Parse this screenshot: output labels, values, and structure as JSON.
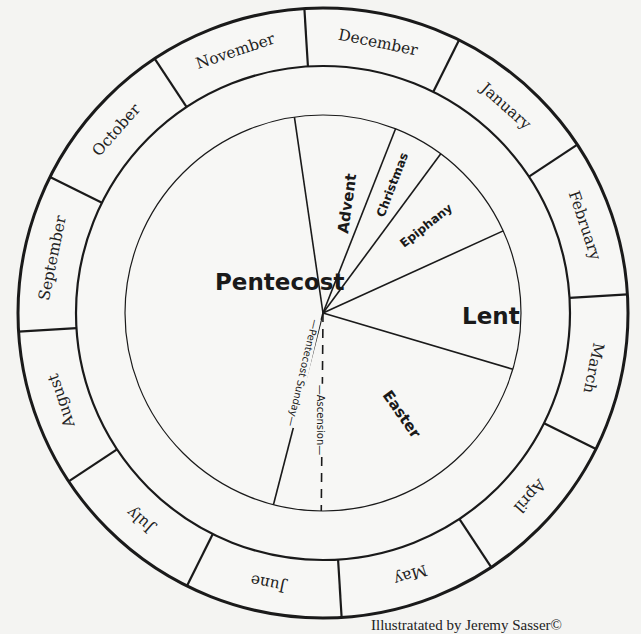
{
  "diagram": {
    "center": [
      323,
      313
    ],
    "radii": {
      "outer": 305,
      "month_inner": 247,
      "band_inner": 198
    },
    "colors": {
      "background": "#f4f4f2",
      "line": "#1a1a1a",
      "grey_band": "#565656",
      "dark_band": "#1e1e1e",
      "white_band": "#f7f7f5"
    },
    "month_divider_offset_deg": -3.5,
    "months": [
      {
        "label": "December",
        "mid_deg": 11.5
      },
      {
        "label": "January",
        "mid_deg": 41.5
      },
      {
        "label": "February",
        "mid_deg": 71.5
      },
      {
        "label": "March",
        "mid_deg": 101.5
      },
      {
        "label": "April",
        "mid_deg": 131.5
      },
      {
        "label": "May",
        "mid_deg": 161.5
      },
      {
        "label": "June",
        "mid_deg": 191.5
      },
      {
        "label": "July",
        "mid_deg": 221.5
      },
      {
        "label": "August",
        "mid_deg": 251.5
      },
      {
        "label": "September",
        "mid_deg": 281.5
      },
      {
        "label": "October",
        "mid_deg": 311.5
      },
      {
        "label": "November",
        "mid_deg": 341.5
      }
    ],
    "band_segments": [
      {
        "name": "advent",
        "start": -8.3,
        "end": 21.5,
        "color": "dark"
      },
      {
        "name": "christmas",
        "start": 21.5,
        "end": 36.5,
        "color": "white"
      },
      {
        "name": "epiphany",
        "start": 36.5,
        "end": 65.5,
        "color": "grey"
      },
      {
        "name": "lent",
        "start": 65.5,
        "end": 106.5,
        "color": "dark"
      },
      {
        "name": "easter",
        "start": 106.5,
        "end": 189.5,
        "color": "white"
      },
      {
        "name": "pentecost-sunday",
        "start": 189.5,
        "end": 197.5,
        "color": "dark"
      },
      {
        "name": "pentecost",
        "start": 197.5,
        "end": 351.7,
        "color": "grey"
      }
    ],
    "season_lines_deg": [
      -8.3,
      21.5,
      36.5,
      65.5,
      106.5,
      194.5
    ],
    "ascension_line_deg": 180.5,
    "seasons": [
      {
        "label": "Pentecost",
        "x": 215,
        "y": 290,
        "rotate": 0,
        "cls": "season-big"
      },
      {
        "label": "Lent",
        "x": 462,
        "y": 324,
        "rotate": 0,
        "cls": "season-big"
      },
      {
        "label": "Easter",
        "x": 382,
        "y": 395,
        "rotate": 55,
        "cls": "season-mid"
      },
      {
        "label": "Advent",
        "x": 348,
        "y": 234,
        "rotate": -82,
        "cls": "season-mid"
      },
      {
        "label": "Christmas",
        "x": 384,
        "y": 218,
        "rotate": -69,
        "cls": "season-small"
      },
      {
        "label": "Epiphany",
        "x": 404,
        "y": 248,
        "rotate": -38,
        "cls": "season-small"
      }
    ],
    "markers": [
      {
        "label": "Ascension",
        "x": 320,
        "y": 420,
        "rotate": 90
      },
      {
        "label": "Pentecost Sunday",
        "x": 303,
        "y": 373,
        "rotate": 103
      }
    ],
    "credit": "Illustratated by Jeremy Sasser©"
  }
}
